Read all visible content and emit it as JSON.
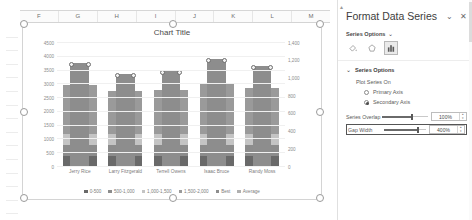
{
  "spreadsheet": {
    "columns": [
      "F",
      "G",
      "H",
      "I",
      "J",
      "K",
      "L",
      "M"
    ],
    "rows": [
      "",
      "",
      "",
      "",
      "",
      "",
      "",
      "",
      "",
      "",
      "",
      "",
      "",
      "",
      ""
    ]
  },
  "chart_data": {
    "type": "bar",
    "title": "Chart Title",
    "xlabel": "",
    "ylabel": "",
    "grid": true,
    "legend_position": "bottom",
    "categories": [
      "Jerry Rice",
      "Larry Fitzgerald",
      "Terrell Owens",
      "Isaac Bruce",
      "Randy Moss"
    ],
    "primary_axis": {
      "name": "Primary Axis",
      "ylim": [
        0,
        4500
      ],
      "ticks": [
        "0",
        "500",
        "1000",
        "1500",
        "2000",
        "2500",
        "3000",
        "3500",
        "4000",
        "4500"
      ]
    },
    "secondary_axis": {
      "name": "Secondary Axis",
      "ylim": [
        0,
        1400
      ],
      "ticks": [
        "0",
        "200",
        "400",
        "600",
        "800",
        "1,000",
        "1,200",
        "1,400"
      ]
    },
    "series": [
      {
        "name": "0-500",
        "axis": "primary",
        "values": [
          500,
          500,
          500,
          500,
          500
        ],
        "color": "#696969"
      },
      {
        "name": "500-1,000",
        "axis": "primary",
        "values": [
          500,
          500,
          500,
          500,
          500
        ],
        "color": "#8c8c8c"
      },
      {
        "name": "1,000-1,500",
        "axis": "primary",
        "values": [
          500,
          500,
          500,
          500,
          500
        ],
        "color": "#c4c4c4"
      },
      {
        "name": "1,500-2,000",
        "axis": "primary",
        "values": [
          2200,
          1900,
          1950,
          2300,
          2050
        ],
        "color": "#9a9a9a"
      },
      {
        "name": "Best",
        "axis": "secondary",
        "values": [
          1170,
          1050,
          1080,
          1215,
          1140
        ],
        "color": "#8d8d8d"
      },
      {
        "name": "Average",
        "axis": "secondary",
        "values": [
          0,
          0,
          0,
          0,
          0
        ],
        "color": "#b0b0b0"
      }
    ]
  },
  "pane": {
    "title": "Format Data Series",
    "collapse_icon": "chevron-down-icon",
    "close_icon": "close-icon",
    "series_options_header": "Series Options",
    "header_chevron": "chevron-down-icon",
    "tabs": [
      {
        "name": "fill-line-icon",
        "label": "Fill & Line",
        "active": false
      },
      {
        "name": "effects-icon",
        "label": "Effects",
        "active": false
      },
      {
        "name": "series-options-icon",
        "label": "Series Options",
        "active": true
      }
    ],
    "section_title": "Series Options",
    "section_chevron": "chevron-down-icon",
    "plot_series_on_label": "Plot Series On",
    "radios": [
      {
        "label": "Primary Axis",
        "selected": false
      },
      {
        "label": "Secondary Axis",
        "selected": true
      }
    ],
    "fields": [
      {
        "label": "Series Overlap",
        "value": "100%",
        "percent": 100,
        "highlighted": false
      },
      {
        "label": "Gap Width",
        "value": "400%",
        "percent": 80,
        "highlighted": true
      }
    ]
  }
}
